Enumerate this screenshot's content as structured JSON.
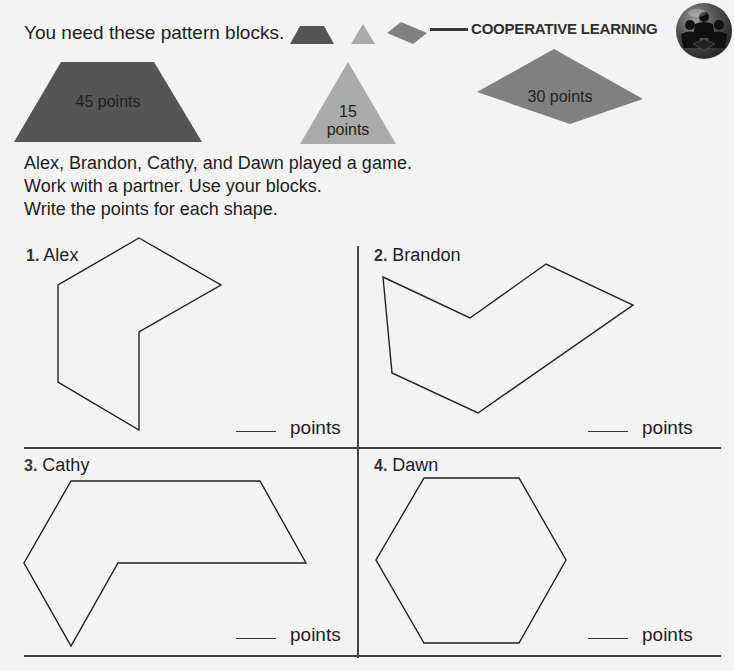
{
  "header": {
    "instruction": "You need these pattern blocks.",
    "section_label": "COOPERATIVE LEARNING",
    "badge_icon": "cooperative-learning-group-icon"
  },
  "pattern_blocks": [
    {
      "shape": "trapezoid",
      "label": "45 points",
      "color": "#555555"
    },
    {
      "shape": "triangle",
      "label_line1": "15",
      "label_line2": "points",
      "color": "#a9a9a9"
    },
    {
      "shape": "rhombus",
      "label": "30 points",
      "color": "#7f7f7f"
    }
  ],
  "intro": {
    "line1": "Alex, Brandon, Cathy, and Dawn played a game.",
    "line2": "Work with a partner. Use your blocks.",
    "line3": "Write the points for each shape."
  },
  "problems": [
    {
      "number": "1.",
      "name": "Alex",
      "answer_value": "",
      "answer_unit": "points"
    },
    {
      "number": "2.",
      "name": "Brandon",
      "answer_value": "",
      "answer_unit": "points"
    },
    {
      "number": "3.",
      "name": "Cathy",
      "answer_value": "",
      "answer_unit": "points"
    },
    {
      "number": "4.",
      "name": "Dawn",
      "answer_value": "",
      "answer_unit": "points"
    }
  ]
}
